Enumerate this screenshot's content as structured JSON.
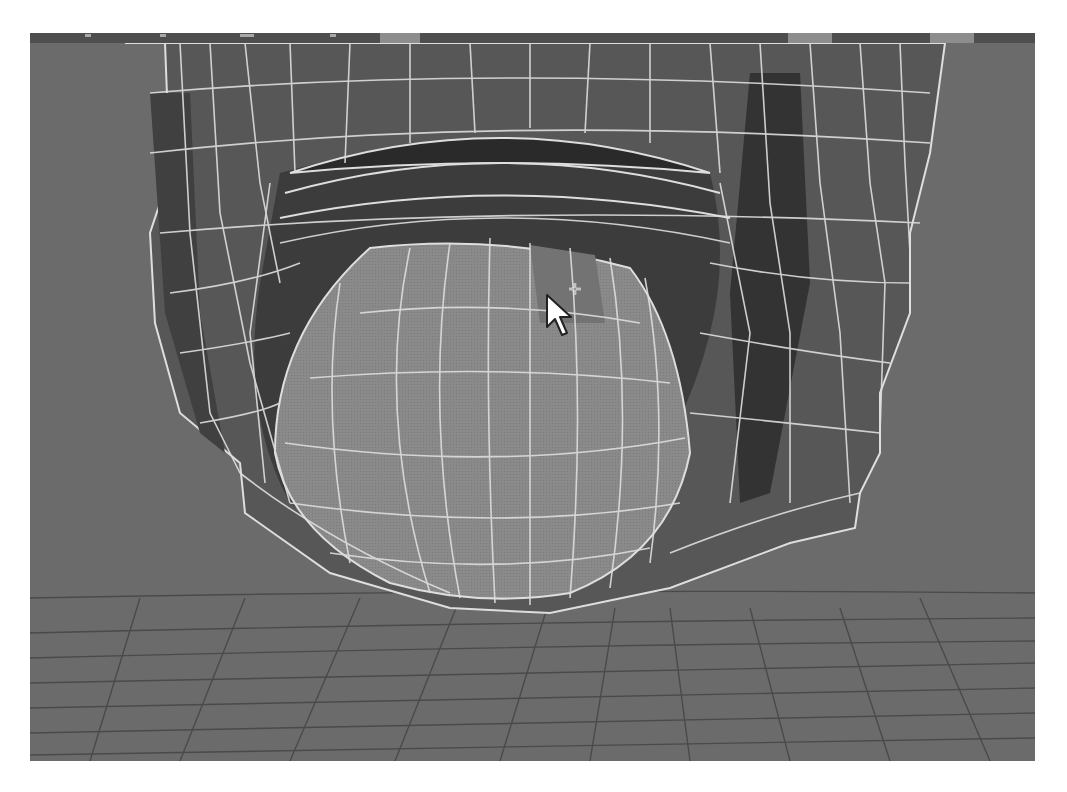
{
  "viewport": {
    "label": "3D perspective viewport",
    "view": "perspective (low angle, looking up at chin/mouth)",
    "display_mode": "smooth shaded with wireframe on shaded",
    "selection_mode": "face",
    "cursor": "select-add-cursor"
  },
  "toolbar": {
    "buttons": [
      {
        "name": "toolbar-button-1",
        "x": 350,
        "w": 40
      },
      {
        "name": "toolbar-button-2",
        "x": 758,
        "w": 44
      },
      {
        "name": "toolbar-button-3",
        "x": 900,
        "w": 44
      }
    ]
  },
  "scene": {
    "objects": [
      {
        "name": "head-mesh",
        "type": "polygon mesh",
        "state": "wireframe-on-shaded"
      },
      {
        "name": "tongue-sphere",
        "type": "polygon sphere",
        "state": "faces selected"
      },
      {
        "name": "ground-grid",
        "type": "grid"
      }
    ]
  },
  "colors": {
    "background": "#6b6b6b",
    "toolbar": "#4e4e4e",
    "toolbar_button": "#8d8d8d",
    "mesh_face": "#555555",
    "mesh_face_dark": "#333333",
    "selected_face": "#8a8a8a",
    "hover_face": "#707070",
    "wire": "#dedede",
    "grid": "#4a4a4a"
  }
}
